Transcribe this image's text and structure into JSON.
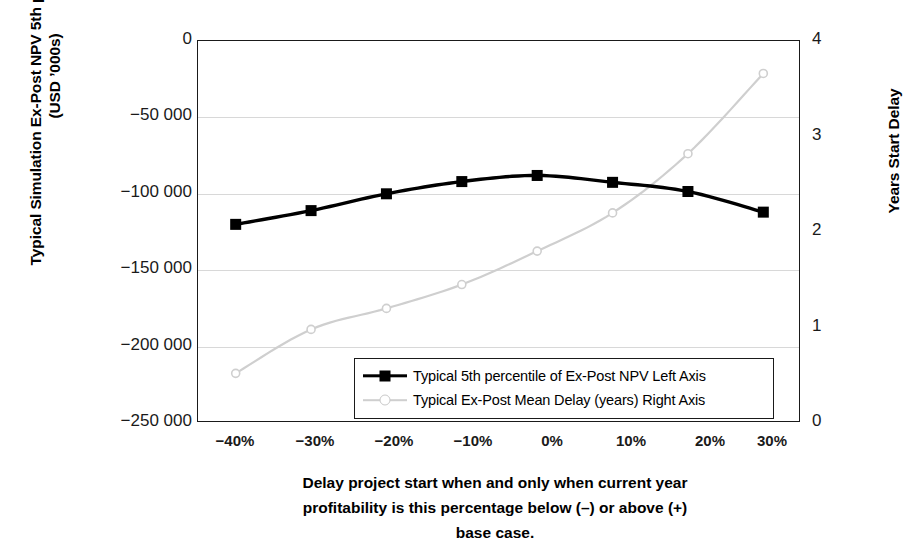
{
  "chart_data": {
    "type": "line",
    "title": "",
    "categories": [
      "-40%",
      "-30%",
      "-20%",
      "-10%",
      "0%",
      "10%",
      "20%",
      "30%"
    ],
    "x_numeric": [
      -40,
      -30,
      -20,
      -10,
      0,
      10,
      20,
      30
    ],
    "xlabel": "Delay project start when and only when current year profitability is this percentage below (–) or above (+) base case.",
    "ylabel": "Typical Simulation Ex-Post NPV 5th percentile Value (USD ’000s)",
    "ylabel_right": "Years Start Delay",
    "ylim": [
      -250000,
      0
    ],
    "ylim_right": [
      0,
      4
    ],
    "yticks": [
      0,
      -50000,
      -100000,
      -150000,
      -200000,
      -250000
    ],
    "ytick_labels": [
      "0",
      "−50 000",
      "−100 000",
      "−150 000",
      "−200 000",
      "−250 000"
    ],
    "yticks_right": [
      4,
      3,
      2,
      1,
      0
    ],
    "ytick_labels_right": [
      "4",
      "3",
      "2",
      "1",
      "0"
    ],
    "grid": true,
    "legend_position": "inside-bottom-center",
    "series": [
      {
        "name": "Typical 5th percentile of Ex-Post NPV  Left Axis",
        "axis": "left",
        "color": "#000000",
        "marker": "square",
        "values": [
          -120000,
          -111000,
          -100000,
          -92000,
          -88000,
          -92500,
          -98500,
          -112000
        ]
      },
      {
        "name": "Typical Ex-Post Mean Delay (years)  Right Axis",
        "axis": "right",
        "color": "#cfcfcf",
        "marker": "circle",
        "values": [
          0.52,
          0.98,
          1.2,
          1.45,
          1.8,
          2.2,
          2.82,
          3.66
        ]
      }
    ]
  },
  "axes": {
    "left_title": "Typical Simulation Ex-Post NPV 5th percentile Value (USD ’000s)",
    "right_title": "Years Start Delay",
    "x_title_line1": "Delay project start when and only when current year",
    "x_title_line2": "profitability is this percentage below (–) or above (+)",
    "x_title_line3": "base case.",
    "y_left_ticks": [
      "0",
      "−50 000",
      "−100 000",
      "−150 000",
      "−200 000",
      "−250 000"
    ],
    "y_right_ticks": [
      "4",
      "3",
      "2",
      "1",
      "0"
    ],
    "x_ticks": [
      "−40%",
      "−30%",
      "−20%",
      "−10%",
      "0%",
      "10%",
      "20%",
      "30%"
    ]
  },
  "legend": {
    "items": [
      {
        "label": "Typical 5th percentile of Ex-Post NPV  Left Axis",
        "key": "dark-square-line"
      },
      {
        "label": "Typical Ex-Post Mean Delay (years)  Right Axis",
        "key": "light-circle-line"
      }
    ]
  },
  "colors": {
    "series_npv": "#000000",
    "series_delay": "#cfcfcf",
    "grid": "#d8d8d8",
    "frame": "#1a1a1a",
    "background": "#ffffff"
  }
}
